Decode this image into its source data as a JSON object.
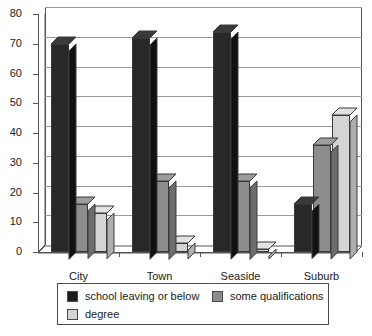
{
  "chart_data": {
    "type": "bar",
    "title": "",
    "subtitle": "",
    "xlabel": "",
    "ylabel": "",
    "categories": [
      "City",
      "Town",
      "Seaside",
      "Suburb"
    ],
    "series": [
      {
        "name": "school leaving or below",
        "color": "#282828",
        "values": [
          70,
          72,
          74,
          16
        ]
      },
      {
        "name": "some qualifications",
        "color": "#8c8c8c",
        "values": [
          16,
          24,
          24,
          36
        ]
      },
      {
        "name": "degree",
        "color": "#d4d4d4",
        "values": [
          13,
          3,
          1,
          46
        ]
      }
    ],
    "ylim": [
      0,
      80
    ],
    "ytick_step": 10,
    "yticks": [
      0,
      10,
      20,
      30,
      40,
      50,
      60,
      70,
      80
    ],
    "ytick_labels": [
      "0",
      "10",
      "20",
      "30",
      "40",
      "50",
      "60",
      "70",
      "80"
    ],
    "grid": true,
    "grid_axis": "y",
    "legend_position": "bottom",
    "style": "3d-grouped-bars-grayscale"
  },
  "legend": {
    "entries": [
      {
        "label": "school leaving or below",
        "series_index": 0
      },
      {
        "label": "some qualifications",
        "series_index": 1
      },
      {
        "label": "degree",
        "series_index": 2
      }
    ]
  },
  "colors": {
    "series_0": "#282828",
    "series_1": "#8c8c8c",
    "series_2": "#d4d4d4",
    "axis": "#555555",
    "gridline": "#9a9a9a",
    "background": "#ffffff",
    "text": "#1a1a1a"
  }
}
